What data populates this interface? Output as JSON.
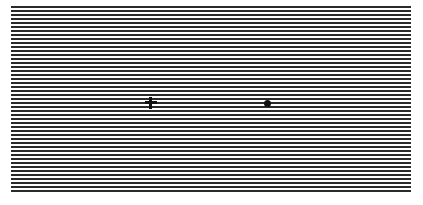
{
  "figure": {
    "grating": {
      "orientation": "horizontal",
      "line_color": "#2a2a2a",
      "background_color": "#ffffff",
      "line_pitch_px": 4,
      "line_thickness_px": 2,
      "line_count": 47
    },
    "markers": [
      {
        "type": "fixation-cross",
        "glyph": "+",
        "color": "#111111"
      },
      {
        "type": "dot",
        "glyph": "•",
        "color": "#111111"
      }
    ],
    "caption": {
      "text": "",
      "note": "cut off at bottom edge; illegible"
    }
  }
}
